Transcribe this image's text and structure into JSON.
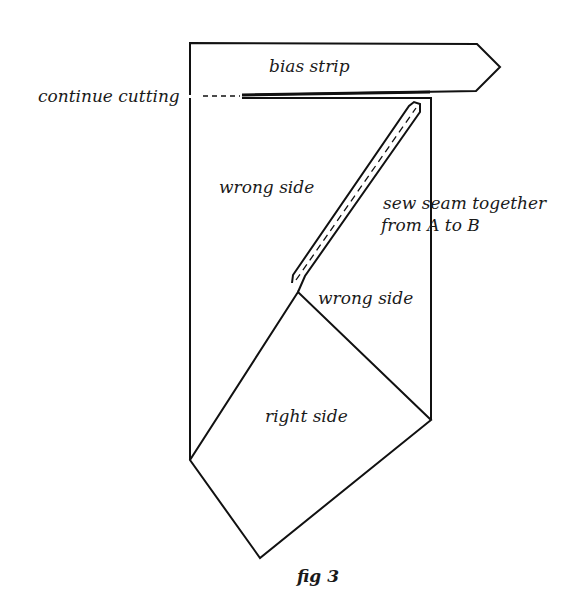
{
  "figure": {
    "caption": "fig 3",
    "labels": {
      "bias_strip": "bias strip",
      "continue_cutting": "continue cutting",
      "wrong_side_left": "wrong side",
      "sew_seam_line1": "sew seam together",
      "sew_seam_line2": "from A to B",
      "wrong_side_fold": "wrong side",
      "right_side": "right side"
    },
    "colors": {
      "line": "#111111",
      "background": "#ffffff"
    }
  }
}
